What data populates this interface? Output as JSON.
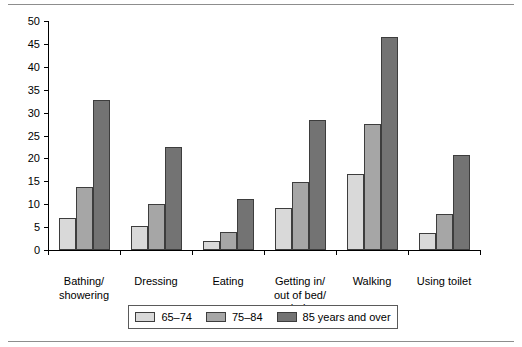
{
  "chart_data": {
    "type": "bar",
    "title": "",
    "subtitle": "",
    "xlabel": "",
    "ylabel": "",
    "ylim": [
      0,
      50
    ],
    "ytick_step": 5,
    "yticks": [
      "0",
      "5",
      "10",
      "15",
      "20",
      "25",
      "30",
      "35",
      "40",
      "45",
      "50"
    ],
    "grid": false,
    "legend_position": "bottom",
    "orientation": "vertical",
    "grouping": "grouped",
    "categories": [
      "Bathing/\nshowering",
      "Dressing",
      "Eating",
      "Getting in/\nout of bed/\nchairs",
      "Walking",
      "Using toilet"
    ],
    "series": [
      {
        "name": "65–74",
        "color": "#d9d9d9",
        "values": [
          7.0,
          5.3,
          1.9,
          9.2,
          16.6,
          3.7
        ]
      },
      {
        "name": "75–84",
        "color": "#a6a6a6",
        "values": [
          13.7,
          10.1,
          3.9,
          14.9,
          27.6,
          7.8
        ]
      },
      {
        "name": "85 years and over",
        "color": "#737373",
        "values": [
          32.8,
          22.6,
          11.1,
          28.4,
          46.6,
          20.8
        ]
      }
    ]
  },
  "legend": {
    "entries": [
      {
        "label": "65–74",
        "color": "#d9d9d9"
      },
      {
        "label": "75–84",
        "color": "#a6a6a6"
      },
      {
        "label": "85 years and over",
        "color": "#737373"
      }
    ]
  },
  "colors": {
    "series_65_74": "#d9d9d9",
    "series_75_84": "#a6a6a6",
    "series_85_over": "#737373",
    "axis": "#000000",
    "bar_outline": "#3d3d3d",
    "rule": "#8d8d8d",
    "background": "#ffffff"
  }
}
